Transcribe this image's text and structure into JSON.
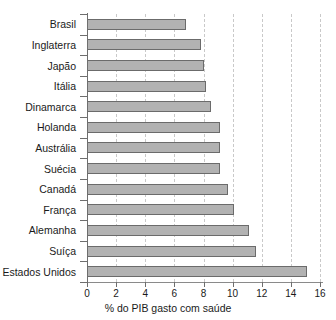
{
  "chart_data": {
    "type": "bar",
    "orientation": "horizontal",
    "title": "",
    "subtitle": "",
    "xlabel": "% do PIB gasto com saúde",
    "ylabel": "",
    "categories": [
      "Brasil",
      "Inglaterra",
      "Japão",
      "Itália",
      "Dinamarca",
      "Holanda",
      "Austrália",
      "Suécia",
      "Canadá",
      "França",
      "Alemanha",
      "Suíça",
      "Estados Unidos"
    ],
    "values": [
      6.8,
      7.8,
      8.0,
      8.2,
      8.5,
      9.1,
      9.1,
      9.1,
      9.7,
      10.1,
      11.1,
      11.6,
      15.1
    ],
    "xlim": [
      0,
      16
    ],
    "xticks": [
      0,
      2,
      4,
      6,
      8,
      10,
      12,
      14,
      16
    ],
    "xtick_labels": [
      "0",
      "2",
      "4",
      "6",
      "8",
      "10",
      "12",
      "14",
      "16"
    ],
    "grid": "vertical-dashed",
    "legend": "none",
    "bar_fill_color": "#b2b2b2",
    "bar_edge_color": "#6b6b6b",
    "axis_color": "#6e6e6e",
    "gridline_color": "#c9c9c9",
    "background_color": "#ffffff",
    "text_color": "#1a1a1a"
  }
}
